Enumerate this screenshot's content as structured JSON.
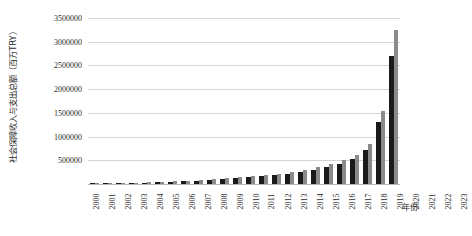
{
  "chart_data": {
    "type": "bar",
    "title": "",
    "xlabel": "年份",
    "ylabel": "社会保障收入与支出总额（百万TRY）",
    "ylim": [
      0,
      3500000
    ],
    "ytick_step": 500000,
    "grid": true,
    "legend": "none",
    "categories": [
      "2000",
      "2001",
      "2002",
      "2003",
      "2004",
      "2005",
      "2006",
      "2007",
      "2008",
      "2009",
      "2010",
      "2011",
      "2012",
      "2013",
      "2014",
      "2015",
      "2016",
      "2017",
      "2018",
      "2019",
      "2020",
      "2021",
      "2022",
      "2023"
    ],
    "yticks": [
      "500000",
      "1000000",
      "1500000",
      "2000000",
      "2500000",
      "3000000",
      "3500000"
    ],
    "ytick_values": [
      500000,
      1000000,
      1500000,
      2000000,
      2500000,
      3000000,
      3500000
    ],
    "series": [
      {
        "name": "社会保障收入总额",
        "color": "#1a1a1a",
        "values": [
          8000,
          12000,
          18000,
          25000,
          30000,
          38000,
          48000,
          58000,
          72000,
          82000,
          98000,
          120000,
          142000,
          165000,
          188000,
          218000,
          255000,
          300000,
          360000,
          430000,
          520000,
          720000,
          1310000,
          2700000
        ]
      },
      {
        "name": "社会保障支出总额",
        "color": "#8a8a8a",
        "values": [
          10000,
          15000,
          22000,
          30000,
          36000,
          46000,
          58000,
          70000,
          86000,
          100000,
          118000,
          140000,
          165000,
          192000,
          220000,
          256000,
          300000,
          352000,
          420000,
          505000,
          610000,
          840000,
          1550000,
          3250000
        ]
      }
    ]
  }
}
